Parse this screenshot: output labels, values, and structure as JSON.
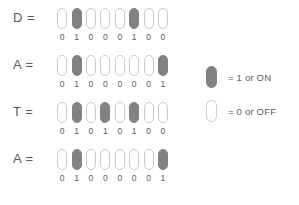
{
  "diagram": {
    "rows": [
      {
        "label": "D  =",
        "letter": "D",
        "bits": [
          "0",
          "1",
          "0",
          "0",
          "0",
          "1",
          "0",
          "0"
        ]
      },
      {
        "label": "A  =",
        "letter": "A",
        "bits": [
          "0",
          "1",
          "0",
          "0",
          "0",
          "0",
          "0",
          "1"
        ]
      },
      {
        "label": "T  =",
        "letter": "T",
        "bits": [
          "0",
          "1",
          "0",
          "1",
          "0",
          "1",
          "0",
          "0"
        ]
      },
      {
        "label": "A  =",
        "letter": "A",
        "bits": [
          "0",
          "1",
          "0",
          "0",
          "0",
          "0",
          "0",
          "1"
        ]
      }
    ],
    "legend": [
      {
        "state": "on",
        "text": "=  1 or ON"
      },
      {
        "state": "off",
        "text": "=  0 or OFF"
      }
    ],
    "colors": {
      "on_fill": "#808285",
      "off_fill": "#ffffff",
      "off_stroke": "#c9cacb",
      "text": "#58595b",
      "background": "#ffffff"
    }
  }
}
